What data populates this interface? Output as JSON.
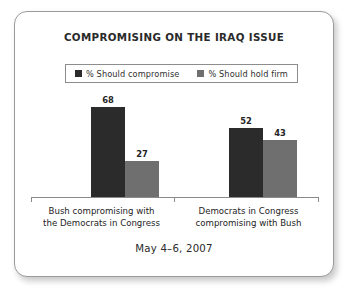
{
  "card": {
    "title": "COMPROMISING ON THE IRAQ ISSUE",
    "footer_date": "May 4–6, 2007"
  },
  "legend": {
    "entries": [
      {
        "label": "% Should compromise",
        "color": "#2b2b2b",
        "swatch_name": "legend-swatch-compromise"
      },
      {
        "label": "% Should hold firm",
        "color": "#6f6f6f",
        "swatch_name": "legend-swatch-hold-firm"
      }
    ]
  },
  "chart_data": {
    "type": "bar",
    "title": "COMPROMISING ON THE IRAQ ISSUE",
    "subtitle": "May 4–6, 2007",
    "xlabel": "",
    "ylabel": "",
    "ylim": [
      0,
      100
    ],
    "grid": false,
    "legend_position": "top",
    "categories": [
      "Bush compromising with the Democrats in Congress",
      "Democrats in Congress compromising with Bush"
    ],
    "category_lines": [
      [
        "Bush compromising with",
        "the Democrats in Congress"
      ],
      [
        "Democrats in Congress",
        "compromising with Bush"
      ]
    ],
    "series": [
      {
        "name": "% Should compromise",
        "color": "#2b2b2b",
        "values": [
          68,
          52
        ]
      },
      {
        "name": "% Should hold firm",
        "color": "#6f6f6f",
        "values": [
          27,
          43
        ]
      }
    ]
  }
}
